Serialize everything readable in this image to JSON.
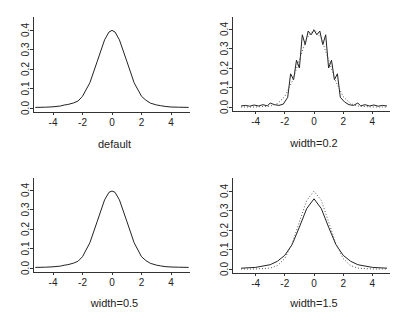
{
  "figure": {
    "panels": [
      {
        "id": "default",
        "xlabel": "default"
      },
      {
        "id": "width-0-2",
        "xlabel": "width=0.2"
      },
      {
        "id": "width-0-5",
        "xlabel": "width=0.5"
      },
      {
        "id": "width-1-5",
        "xlabel": "width=1.5"
      }
    ],
    "xticks": [
      "-4",
      "-2",
      "0",
      "2",
      "4"
    ],
    "yticks": [
      "0.0",
      "0.1",
      "0.2",
      "0.3",
      "0.4"
    ]
  },
  "chart_data": [
    {
      "type": "line",
      "title": "",
      "xlabel": "default",
      "ylabel": "",
      "xlim": [
        -5.3,
        5.3
      ],
      "ylim": [
        0,
        0.45
      ],
      "x_ticks": [
        -4,
        -2,
        0,
        2,
        4
      ],
      "y_ticks": [
        0.0,
        0.1,
        0.2,
        0.3,
        0.4
      ],
      "series": [
        {
          "name": "density estimate",
          "style": "solid",
          "x": [
            -5.2,
            -4.5,
            -4.0,
            -3.5,
            -3.2,
            -3.0,
            -2.6,
            -2.3,
            -2.0,
            -1.5,
            -1.0,
            -0.5,
            -0.2,
            0.0,
            0.2,
            0.5,
            1.0,
            1.5,
            2.0,
            2.3,
            2.6,
            3.0,
            3.3,
            3.6,
            4.0,
            4.5,
            5.2
          ],
          "y": [
            0.003,
            0.004,
            0.006,
            0.01,
            0.016,
            0.018,
            0.026,
            0.036,
            0.06,
            0.13,
            0.24,
            0.35,
            0.39,
            0.398,
            0.39,
            0.35,
            0.24,
            0.13,
            0.06,
            0.04,
            0.025,
            0.016,
            0.012,
            0.008,
            0.005,
            0.004,
            0.003
          ]
        }
      ]
    },
    {
      "type": "line",
      "title": "",
      "xlabel": "width=0.2",
      "ylabel": "",
      "xlim": [
        -5.3,
        5.3
      ],
      "ylim": [
        0,
        0.45
      ],
      "x_ticks": [
        -4,
        -2,
        0,
        2,
        4
      ],
      "y_ticks": [
        0.0,
        0.1,
        0.2,
        0.3,
        0.4
      ],
      "series": [
        {
          "name": "density estimate (width=0.2)",
          "style": "solid",
          "x": [
            -5.0,
            -4.7,
            -4.4,
            -4.1,
            -3.8,
            -3.5,
            -3.2,
            -3.0,
            -2.7,
            -2.4,
            -2.1,
            -1.8,
            -1.6,
            -1.4,
            -1.2,
            -1.0,
            -0.8,
            -0.6,
            -0.4,
            -0.2,
            0.0,
            0.2,
            0.4,
            0.6,
            0.8,
            1.0,
            1.2,
            1.4,
            1.6,
            1.8,
            2.1,
            2.4,
            2.7,
            3.0,
            3.2,
            3.5,
            3.8,
            4.1,
            4.4,
            4.7,
            5.0
          ],
          "y": [
            0.005,
            0.008,
            0.004,
            0.01,
            0.005,
            0.012,
            0.006,
            0.02,
            0.012,
            0.008,
            0.015,
            0.05,
            0.17,
            0.14,
            0.24,
            0.2,
            0.37,
            0.32,
            0.39,
            0.37,
            0.395,
            0.37,
            0.39,
            0.32,
            0.37,
            0.2,
            0.24,
            0.14,
            0.17,
            0.05,
            0.025,
            0.012,
            0.008,
            0.02,
            0.006,
            0.012,
            0.005,
            0.01,
            0.004,
            0.008,
            0.005
          ]
        },
        {
          "name": "normal reference",
          "style": "dotted",
          "x": [
            -5.0,
            -4.0,
            -3.0,
            -2.5,
            -2.0,
            -1.5,
            -1.0,
            -0.5,
            0.0,
            0.5,
            1.0,
            1.5,
            2.0,
            2.5,
            3.0,
            4.0,
            5.0
          ],
          "y": [
            0.0,
            0.0001,
            0.0044,
            0.0175,
            0.054,
            0.1295,
            0.242,
            0.352,
            0.399,
            0.352,
            0.242,
            0.1295,
            0.054,
            0.0175,
            0.0044,
            0.0001,
            0.0
          ]
        }
      ]
    },
    {
      "type": "line",
      "title": "",
      "xlabel": "width=0.5",
      "ylabel": "",
      "xlim": [
        -5.3,
        5.3
      ],
      "ylim": [
        0,
        0.45
      ],
      "x_ticks": [
        -4,
        -2,
        0,
        2,
        4
      ],
      "y_ticks": [
        0.0,
        0.1,
        0.2,
        0.3,
        0.4
      ],
      "series": [
        {
          "name": "density estimate (width=0.5)",
          "style": "solid",
          "x": [
            -5.2,
            -4.5,
            -4.0,
            -3.5,
            -3.2,
            -3.0,
            -2.6,
            -2.3,
            -2.0,
            -1.5,
            -1.0,
            -0.5,
            -0.2,
            0.0,
            0.2,
            0.5,
            1.0,
            1.5,
            2.0,
            2.3,
            2.6,
            3.0,
            3.3,
            3.6,
            4.0,
            4.5,
            5.2
          ],
          "y": [
            0.003,
            0.004,
            0.006,
            0.01,
            0.015,
            0.017,
            0.025,
            0.035,
            0.058,
            0.13,
            0.24,
            0.35,
            0.388,
            0.395,
            0.388,
            0.35,
            0.24,
            0.13,
            0.058,
            0.038,
            0.024,
            0.015,
            0.011,
            0.007,
            0.005,
            0.004,
            0.003
          ]
        }
      ]
    },
    {
      "type": "line",
      "title": "",
      "xlabel": "width=1.5",
      "ylabel": "",
      "xlim": [
        -5.3,
        5.3
      ],
      "ylim": [
        0,
        0.45
      ],
      "x_ticks": [
        -4,
        -2,
        0,
        2,
        4
      ],
      "y_ticks": [
        0.0,
        0.1,
        0.2,
        0.3,
        0.4
      ],
      "series": [
        {
          "name": "density estimate (width=1.5)",
          "style": "solid",
          "x": [
            -5.0,
            -4.0,
            -3.0,
            -2.5,
            -2.0,
            -1.5,
            -1.0,
            -0.5,
            0.0,
            0.5,
            1.0,
            1.5,
            2.0,
            2.5,
            3.0,
            4.0,
            5.0
          ],
          "y": [
            0.004,
            0.008,
            0.022,
            0.04,
            0.07,
            0.125,
            0.215,
            0.31,
            0.36,
            0.31,
            0.215,
            0.125,
            0.07,
            0.04,
            0.022,
            0.008,
            0.004
          ]
        },
        {
          "name": "normal reference",
          "style": "dotted",
          "x": [
            -5.0,
            -4.0,
            -3.0,
            -2.5,
            -2.0,
            -1.5,
            -1.0,
            -0.5,
            0.0,
            0.5,
            1.0,
            1.5,
            2.0,
            2.5,
            3.0,
            4.0,
            5.0
          ],
          "y": [
            0.0,
            0.0001,
            0.0044,
            0.0175,
            0.054,
            0.1295,
            0.242,
            0.352,
            0.399,
            0.352,
            0.242,
            0.1295,
            0.054,
            0.0175,
            0.0044,
            0.0001,
            0.0
          ]
        }
      ]
    }
  ]
}
